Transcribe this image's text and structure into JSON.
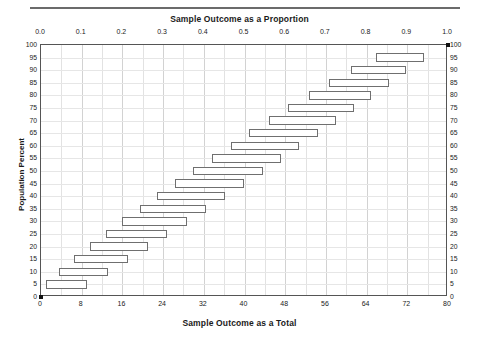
{
  "chart_data": {
    "type": "bar",
    "title": "Sample Outcome as a Proportion",
    "xlabel": "Sample Outcome as a Total",
    "ylabel": "Population Percent",
    "orientation": "horizontal",
    "grid": true,
    "legend": false,
    "top_axis": {
      "label": "Sample Outcome as a Proportion",
      "range": [
        0.0,
        1.0
      ],
      "ticks": [
        "0.0",
        "0.1",
        "0.2",
        "0.3",
        "0.4",
        "0.5",
        "0.6",
        "0.7",
        "0.8",
        "0.9",
        "1.0"
      ],
      "tick_values": [
        0.0,
        0.1,
        0.2,
        0.3,
        0.4,
        0.5,
        0.6,
        0.7,
        0.8,
        0.9,
        1.0
      ],
      "minor_step": 0.05
    },
    "bottom_axis": {
      "label": "Sample Outcome as a Total",
      "range": [
        0,
        80
      ],
      "ticks": [
        "0",
        "8",
        "16",
        "24",
        "32",
        "40",
        "48",
        "56",
        "64",
        "72",
        "80"
      ],
      "tick_values": [
        0,
        8,
        16,
        24,
        32,
        40,
        48,
        56,
        64,
        72,
        80
      ]
    },
    "y_axis": {
      "label": "Population Percent",
      "range": [
        0,
        100
      ],
      "step": 5,
      "ticks": [
        "0",
        "5",
        "10",
        "15",
        "20",
        "25",
        "30",
        "35",
        "40",
        "45",
        "50",
        "55",
        "60",
        "65",
        "70",
        "75",
        "80",
        "85",
        "90",
        "95",
        "100"
      ],
      "tick_values": [
        0,
        5,
        10,
        15,
        20,
        25,
        30,
        35,
        40,
        45,
        50,
        55,
        60,
        65,
        70,
        75,
        80,
        85,
        90,
        95,
        100
      ]
    },
    "categories": [
      5,
      10,
      15,
      20,
      25,
      30,
      35,
      40,
      45,
      50,
      55,
      60,
      65,
      70,
      75,
      80,
      85,
      90,
      95
    ],
    "intervals": [
      {
        "population_percent": 5,
        "low": 0.012,
        "high": 0.112
      },
      {
        "population_percent": 10,
        "low": 0.045,
        "high": 0.165
      },
      {
        "population_percent": 15,
        "low": 0.08,
        "high": 0.215
      },
      {
        "population_percent": 20,
        "low": 0.12,
        "high": 0.262
      },
      {
        "population_percent": 25,
        "low": 0.16,
        "high": 0.31
      },
      {
        "population_percent": 30,
        "low": 0.2,
        "high": 0.358
      },
      {
        "population_percent": 35,
        "low": 0.243,
        "high": 0.405
      },
      {
        "population_percent": 40,
        "low": 0.286,
        "high": 0.452
      },
      {
        "population_percent": 45,
        "low": 0.33,
        "high": 0.498
      },
      {
        "population_percent": 50,
        "low": 0.374,
        "high": 0.545
      },
      {
        "population_percent": 55,
        "low": 0.42,
        "high": 0.59
      },
      {
        "population_percent": 60,
        "low": 0.466,
        "high": 0.635
      },
      {
        "population_percent": 65,
        "low": 0.512,
        "high": 0.68
      },
      {
        "population_percent": 70,
        "low": 0.56,
        "high": 0.724
      },
      {
        "population_percent": 75,
        "low": 0.608,
        "high": 0.768
      },
      {
        "population_percent": 80,
        "low": 0.658,
        "high": 0.812
      },
      {
        "population_percent": 85,
        "low": 0.708,
        "high": 0.855
      },
      {
        "population_percent": 90,
        "low": 0.762,
        "high": 0.897
      },
      {
        "population_percent": 95,
        "low": 0.822,
        "high": 0.94
      }
    ],
    "corner_markers": [
      {
        "x": 0.0,
        "y": 0
      },
      {
        "x": 1.0,
        "y": 100
      }
    ],
    "colors": {
      "bar_border": "#6f6f6f",
      "bar_fill": "#ffffff",
      "axis": "#555555",
      "grid": "#e2e2e2",
      "text": "#1a1a1a",
      "top_rule": "#6b6b6b"
    }
  }
}
